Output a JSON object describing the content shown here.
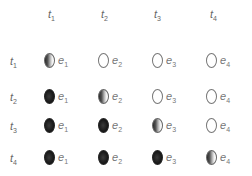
{
  "columns": [
    {
      "base": "t",
      "sub": "1"
    },
    {
      "base": "t",
      "sub": "2"
    },
    {
      "base": "t",
      "sub": "3"
    },
    {
      "base": "t",
      "sub": "4"
    }
  ],
  "rows": [
    {
      "label": {
        "base": "t",
        "sub": "1"
      },
      "cells": [
        {
          "state": "half",
          "base": "e",
          "sub": "1"
        },
        {
          "state": "empty",
          "base": "e",
          "sub": "2"
        },
        {
          "state": "empty",
          "base": "e",
          "sub": "3"
        },
        {
          "state": "empty",
          "base": "e",
          "sub": "4"
        }
      ]
    },
    {
      "label": {
        "base": "t",
        "sub": "2"
      },
      "cells": [
        {
          "state": "filled",
          "base": "e",
          "sub": "1"
        },
        {
          "state": "half",
          "base": "e",
          "sub": "2"
        },
        {
          "state": "empty",
          "base": "e",
          "sub": "3"
        },
        {
          "state": "empty",
          "base": "e",
          "sub": "4"
        }
      ]
    },
    {
      "label": {
        "base": "t",
        "sub": "3"
      },
      "cells": [
        {
          "state": "filled",
          "base": "e",
          "sub": "1"
        },
        {
          "state": "filled",
          "base": "e",
          "sub": "2"
        },
        {
          "state": "half",
          "base": "e",
          "sub": "3"
        },
        {
          "state": "empty",
          "base": "e",
          "sub": "4"
        }
      ]
    },
    {
      "label": {
        "base": "t",
        "sub": "4"
      },
      "cells": [
        {
          "state": "filled",
          "base": "e",
          "sub": "1"
        },
        {
          "state": "filled",
          "base": "e",
          "sub": "2"
        },
        {
          "state": "filled",
          "base": "e",
          "sub": "3"
        },
        {
          "state": "half",
          "base": "e",
          "sub": "4"
        }
      ]
    }
  ],
  "legend_states": {
    "empty": "not started",
    "half": "in progress",
    "filled": "complete"
  }
}
